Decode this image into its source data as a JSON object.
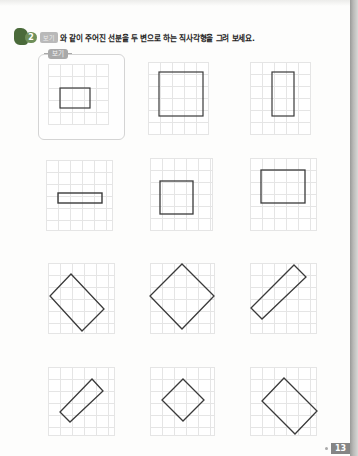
{
  "header": {
    "question_number": "2",
    "example_tag": "보기",
    "instruction": "와 같이 주어진 선분을 두 변으로 하는 직사각형을 그려 보세요."
  },
  "example": {
    "label": "보기"
  },
  "panels": [
    {
      "id": "example",
      "shape": "rectangle",
      "orientation": "axis-aligned"
    },
    {
      "id": "p1",
      "shape": "square",
      "orientation": "axis-aligned"
    },
    {
      "id": "p2",
      "shape": "tall-rectangle",
      "orientation": "axis-aligned"
    },
    {
      "id": "p3",
      "shape": "thin-wide-rectangle",
      "orientation": "axis-aligned"
    },
    {
      "id": "p4",
      "shape": "square",
      "orientation": "axis-aligned"
    },
    {
      "id": "p5",
      "shape": "rectangle",
      "orientation": "axis-aligned"
    },
    {
      "id": "p6",
      "shape": "rectangle",
      "orientation": "diagonal"
    },
    {
      "id": "p7",
      "shape": "square",
      "orientation": "diagonal"
    },
    {
      "id": "p8",
      "shape": "long-thin-rectangle",
      "orientation": "diagonal"
    },
    {
      "id": "p9",
      "shape": "long-thin-rectangle",
      "orientation": "diagonal"
    },
    {
      "id": "p10",
      "shape": "small-square",
      "orientation": "diagonal"
    },
    {
      "id": "p11",
      "shape": "rectangle",
      "orientation": "diagonal"
    }
  ],
  "footer": {
    "page_number": "13"
  },
  "colors": {
    "line": "#3a3a3a",
    "grid": "#e5e5e5",
    "header_icon": "#4a6a3a",
    "page_badge": "#858585"
  }
}
